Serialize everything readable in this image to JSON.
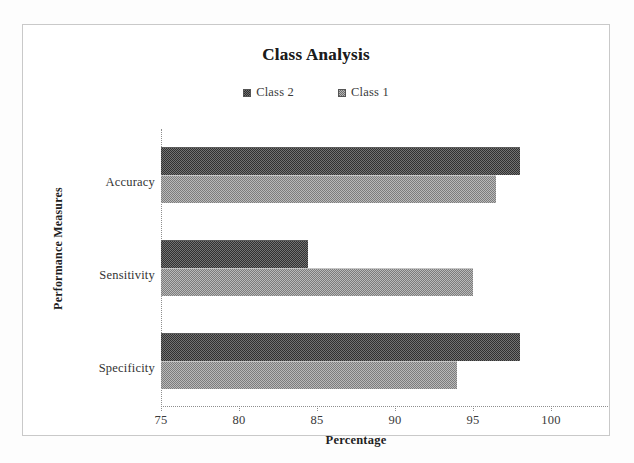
{
  "chart_data": {
    "type": "bar",
    "orientation": "horizontal",
    "title": "Class Analysis",
    "xlabel": "Percentage",
    "ylabel": "Performance Measures",
    "categories": [
      "Accuracy",
      "Sensitivity",
      "Specificity"
    ],
    "series": [
      {
        "name": "Class 2",
        "values": [
          98.0,
          84.4,
          98.0
        ],
        "color": "#4f4f4f"
      },
      {
        "name": "Class 1",
        "values": [
          96.5,
          95.0,
          94.0
        ],
        "color": "#969696"
      }
    ],
    "xlim": [
      75,
      100
    ],
    "xticks": [
      75,
      80,
      85,
      90,
      95,
      100
    ],
    "xtick_labels": [
      "75",
      "80",
      "85",
      "90",
      "95",
      "100"
    ],
    "grid": false,
    "legend_position": "top-center"
  },
  "chart": {
    "title": "Class Analysis",
    "x_axis_title": "Percentage",
    "y_axis_title": "Performance Measures",
    "legend": [
      {
        "label": "Class 2",
        "swatch": "legend-swatch-dark"
      },
      {
        "label": "Class 1",
        "swatch": "legend-swatch-light"
      }
    ],
    "x_tick_labels": [
      "75",
      "80",
      "85",
      "90",
      "95",
      "100"
    ],
    "category_labels": [
      "Accuracy",
      "Sensitivity",
      "Specificity"
    ],
    "colors": {
      "class2": "#4f4f4f",
      "class1": "#969696",
      "axis": "#8e8e8e",
      "frame": "#c9c9c9",
      "text": "#2b2b2b"
    }
  }
}
